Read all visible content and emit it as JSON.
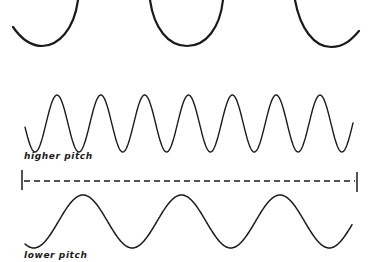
{
  "diagram": {
    "title": "",
    "colors": {
      "stroke": "#1a1a1a",
      "background": "#ffffff"
    },
    "top_partial_wave": {
      "description": "cropped bottoms of a large wave (three troughs visible)",
      "troughs_x": [
        42,
        187,
        330
      ],
      "trough_y": 46
    },
    "higher_pitch_wave": {
      "label": "higher pitch",
      "cycles_visible": 7,
      "peaks_x": [
        57,
        99,
        143,
        187,
        230,
        274,
        320
      ],
      "peak_y": 95,
      "trough_y": 152,
      "x_start": 25,
      "x_end": 353
    },
    "time_span_marker": {
      "style": "dashed",
      "x_start": 22,
      "x_end": 357,
      "y": 181
    },
    "lower_pitch_wave": {
      "label": "lower pitch",
      "cycles_visible": 3,
      "peaks_x": [
        83,
        183,
        280
      ],
      "peak_y": 195,
      "trough_y": 248,
      "x_start": 25,
      "x_end": 352
    }
  }
}
